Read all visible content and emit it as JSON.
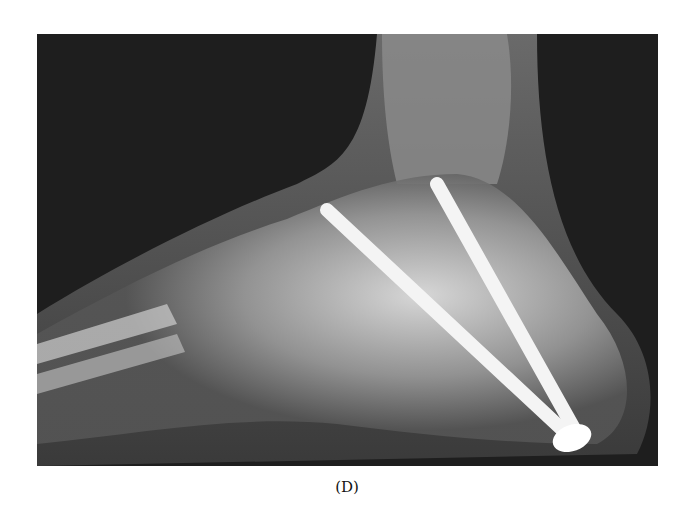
{
  "figure": {
    "caption": "(D)",
    "image_alt": "Lateral foot X-ray showing two long surgical screws fixing the hindfoot (calcaneus/talus)",
    "colors": {
      "background": "#1e1e1e",
      "bone": "#bdbdbd",
      "hardware": "#f4f4f4"
    }
  }
}
